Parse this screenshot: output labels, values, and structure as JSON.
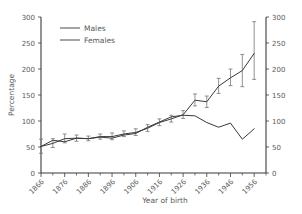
{
  "chart_data": {
    "type": "line",
    "title": "",
    "xlabel": "Year of birth",
    "ylabel": "Percentage",
    "xlim": [
      1866,
      1961
    ],
    "ylim": [
      0,
      300
    ],
    "ytick_labels": [
      "0",
      "50",
      "100",
      "150",
      "200",
      "250",
      "300"
    ],
    "yticks": [
      0,
      50,
      100,
      150,
      200,
      250,
      300
    ],
    "xtick_labels": [
      "1866",
      "1876",
      "1886",
      "1896",
      "1906",
      "1916",
      "1926",
      "1936",
      "1946",
      "1956"
    ],
    "xticks": [
      1866,
      1876,
      1886,
      1896,
      1906,
      1916,
      1926,
      1936,
      1946,
      1956
    ],
    "xminor_step": 5,
    "grid": false,
    "right_axis": true,
    "right_ytick_labels": [
      "0",
      "50",
      "100",
      "150",
      "200",
      "250",
      "300"
    ],
    "legend_position": "top-left",
    "error_bars": true,
    "x": [
      1866,
      1871,
      1876,
      1881,
      1886,
      1891,
      1896,
      1901,
      1906,
      1911,
      1916,
      1921,
      1926,
      1931,
      1936,
      1941,
      1946,
      1951,
      1956
    ],
    "series": [
      {
        "name": "Males",
        "values": [
          51,
          57,
          66,
          67,
          66,
          70,
          70,
          75,
          78,
          86,
          97,
          104,
          112,
          140,
          137,
          167,
          183,
          197,
          230
        ],
        "err_low": [
          38,
          49,
          58,
          61,
          62,
          65,
          64,
          70,
          72,
          80,
          91,
          98,
          105,
          129,
          126,
          153,
          168,
          166,
          180
        ],
        "err_high": [
          65,
          66,
          75,
          73,
          71,
          75,
          77,
          81,
          85,
          93,
          104,
          111,
          120,
          152,
          148,
          182,
          200,
          228,
          291
        ]
      },
      {
        "name": "Females",
        "values": [
          51,
          63,
          60,
          67,
          66,
          69,
          67,
          73,
          76,
          88,
          98,
          108,
          111,
          110,
          97,
          88,
          96,
          65,
          85
        ]
      }
    ],
    "legend_entries": [
      "Males",
      "Females"
    ],
    "colors": {
      "males_line": "#3a3a3a",
      "females_line": "#3a3a3a",
      "axis": "#3b3b3b",
      "text": "#5a5a5a",
      "errorbar": "#6e6e6e",
      "background": "#ffffff"
    }
  }
}
